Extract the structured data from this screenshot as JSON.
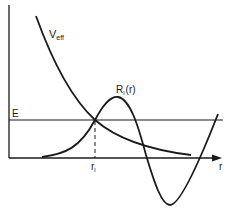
{
  "diagram": {
    "type": "effective-potential-wavefunction",
    "labels": {
      "potential": "V",
      "potential_sub": "eff",
      "wavefunction": "R",
      "wavefunction_sub": "l",
      "wavefunction_arg": "(r)",
      "energy": "E",
      "turning_point": "r",
      "turning_point_sub": "l",
      "x_axis": "r"
    },
    "colors": {
      "line": "#1a1a1a",
      "background": "#ffffff"
    }
  }
}
